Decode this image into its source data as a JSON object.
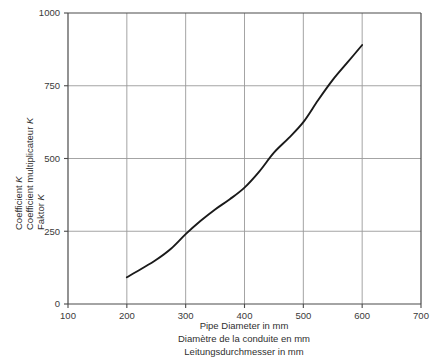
{
  "chart_data": {
    "type": "line",
    "title": "",
    "xlabel": "Pipe Diameter in mm",
    "ylabel": "Coefficient K",
    "xlim": [
      100,
      700
    ],
    "ylim": [
      0,
      1000
    ],
    "grid": true,
    "legend": null,
    "x_ticks": [
      100,
      200,
      300,
      400,
      500,
      600,
      700
    ],
    "y_ticks": [
      0,
      250,
      500,
      750,
      1000
    ],
    "x_tick_labels": [
      "100",
      "200",
      "300",
      "400",
      "500",
      "600",
      "700"
    ],
    "y_tick_labels": [
      "0",
      "250",
      "500",
      "750",
      "1000"
    ],
    "x_axis_captions": [
      "Pipe Diameter in mm",
      "Diamètre de la conduite en mm",
      "Leitungsdurchmesser in mm"
    ],
    "y_axis_captions": [
      "Coefficient K",
      "Coefficient multiplicateur K",
      "Faktor K"
    ],
    "series": [
      {
        "name": "K vs pipe diameter",
        "color": "#1a1a1a",
        "x": [
          200,
          225,
          250,
          275,
          300,
          325,
          350,
          375,
          400,
          425,
          450,
          475,
          500,
          525,
          550,
          575,
          600
        ],
        "y": [
          92,
          121,
          152,
          190,
          240,
          285,
          325,
          360,
          400,
          455,
          520,
          570,
          625,
          700,
          770,
          830,
          890
        ]
      }
    ]
  },
  "figure": {
    "background_color": "#ffffff",
    "grid_color": "#9a9a9a",
    "axis_color": "#4a4a4a",
    "curve_color": "#1a1a1a"
  }
}
